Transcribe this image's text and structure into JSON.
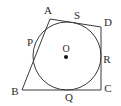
{
  "figure": {
    "type": "geometry-diagram",
    "canvas": {
      "width": 121,
      "height": 106,
      "background": "#ffffff"
    },
    "stroke_color": "#3a3a3a",
    "stroke_width": 1,
    "quadrilateral": {
      "name": "ABCD",
      "vertices": [
        {
          "label": "A",
          "x": 50,
          "y": 19,
          "label_x": 48,
          "label_y": 10
        },
        {
          "label": "D",
          "x": 101,
          "y": 27,
          "label_x": 108,
          "label_y": 22
        },
        {
          "label": "C",
          "x": 101,
          "y": 90,
          "label_x": 108,
          "label_y": 88
        },
        {
          "label": "B",
          "x": 22,
          "y": 90,
          "label_x": 15,
          "label_y": 91
        }
      ]
    },
    "circle": {
      "center_label": "O",
      "cx": 67,
      "cy": 56,
      "r": 34,
      "center_label_x": 66,
      "center_label_y": 48,
      "center_dot_r": 2
    },
    "tangent_points": [
      {
        "label": "P",
        "side": "AB",
        "x": 37,
        "y": 44,
        "label_x": 30,
        "label_y": 42
      },
      {
        "label": "S",
        "side": "AD",
        "x": 72,
        "y": 22,
        "label_x": 77,
        "label_y": 15
      },
      {
        "label": "R",
        "side": "DC",
        "x": 101,
        "y": 56,
        "label_x": 107,
        "label_y": 59
      },
      {
        "label": "Q",
        "side": "BC",
        "x": 67,
        "y": 90,
        "label_x": 69,
        "label_y": 97
      }
    ]
  }
}
